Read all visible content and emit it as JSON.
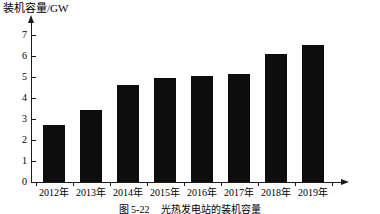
{
  "chart_data": {
    "type": "bar",
    "title": "",
    "xlabel": "",
    "ylabel": "装机容量/GW",
    "categories": [
      "2012年",
      "2013年",
      "2014年",
      "2015年",
      "2016年",
      "2017年",
      "2018年",
      "2019年"
    ],
    "values": [
      2.7,
      3.4,
      4.6,
      4.95,
      5.05,
      5.15,
      6.1,
      6.5
    ],
    "ylim": [
      0,
      7.6
    ],
    "y_ticks": [
      0,
      1,
      2,
      3,
      4,
      5,
      6,
      7
    ],
    "y_tick_labels": [
      "0",
      "1",
      "2",
      "3",
      "4",
      "5",
      "6",
      "7"
    ],
    "grid": false,
    "legend": null,
    "bar_color": "#0d0d0d",
    "axis_color": "#1a1a1a"
  },
  "caption": {
    "number": "图 5-22",
    "text": "光热发电站的装机容量"
  }
}
